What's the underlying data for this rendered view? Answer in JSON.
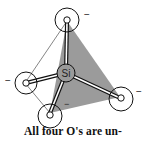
{
  "diagram": {
    "center_atom": {
      "label": "Si"
    },
    "oxygens": [
      {
        "id": "top",
        "label": "o",
        "charge": "−"
      },
      {
        "id": "left",
        "label": "o",
        "charge": "−"
      },
      {
        "id": "bottom",
        "label": "o",
        "charge": "−"
      },
      {
        "id": "right",
        "label": "o",
        "charge": "−"
      }
    ],
    "face_color": "#8a8a8a",
    "caption": "All four O's are un-"
  }
}
